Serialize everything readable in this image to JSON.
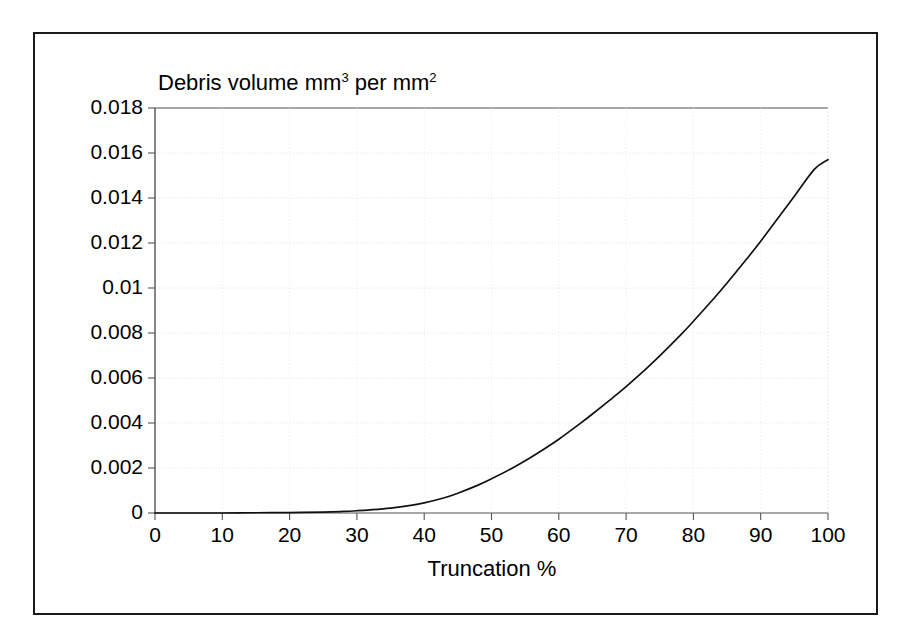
{
  "figure": {
    "background_color": "#ffffff",
    "frame_color": "#1a1a1a",
    "curve_color": "#111111",
    "grid_color": "#d9d9d9"
  },
  "chart_data": {
    "type": "line",
    "title_parts": {
      "base1": "Debris volume mm",
      "sup1": "3",
      "base2": " per mm",
      "sup2": "2"
    },
    "xlabel": "Truncation %",
    "ylabel": "",
    "xlim": [
      0,
      100
    ],
    "ylim": [
      0,
      0.018
    ],
    "grid": true,
    "legend": "none",
    "xticks": [
      0,
      10,
      20,
      30,
      40,
      50,
      60,
      70,
      80,
      90,
      100
    ],
    "xtick_labels": [
      "0",
      "10",
      "20",
      "30",
      "40",
      "50",
      "60",
      "70",
      "80",
      "90",
      "100"
    ],
    "yticks": [
      0,
      0.002,
      0.004,
      0.006,
      0.008,
      0.01,
      0.012,
      0.014,
      0.016,
      0.018
    ],
    "ytick_labels": [
      "0",
      "0.002",
      "0.004",
      "0.006",
      "0.008",
      "0.01",
      "0.012",
      "0.014",
      "0.016",
      "0.018"
    ],
    "series": [
      {
        "name": "Debris volume",
        "x": [
          0,
          5,
          10,
          15,
          20,
          25,
          28,
          30,
          32,
          35,
          38,
          40,
          43,
          45,
          48,
          50,
          53,
          55,
          58,
          60,
          63,
          65,
          68,
          70,
          73,
          75,
          78,
          80,
          83,
          85,
          88,
          90,
          93,
          95,
          98,
          100
        ],
        "values": [
          0,
          0,
          0,
          1e-05,
          2e-05,
          4e-05,
          7e-05,
          0.0001,
          0.00014,
          0.00022,
          0.00034,
          0.00045,
          0.00068,
          0.00088,
          0.00124,
          0.00152,
          0.00198,
          0.00232,
          0.00288,
          0.00328,
          0.00394,
          0.0044,
          0.00512,
          0.00562,
          0.00642,
          0.00698,
          0.00788,
          0.00852,
          0.00952,
          0.01022,
          0.01132,
          0.01208,
          0.01328,
          0.01408,
          0.01528,
          0.0157
        ]
      }
    ]
  }
}
